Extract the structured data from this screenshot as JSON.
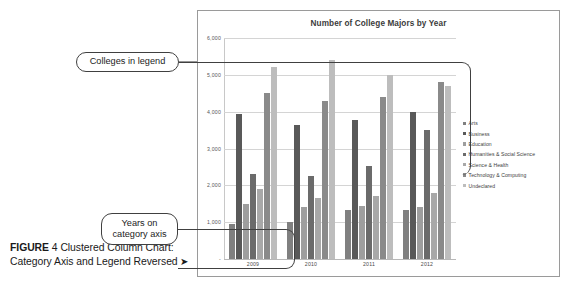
{
  "figure": {
    "caption_label": "FIGURE",
    "caption_number": "4",
    "caption_text": "Clustered Column Chart: Category Axis and Legend Reversed",
    "caption_arrow": "➤"
  },
  "callouts": [
    {
      "id": "legend-callout",
      "text": "Colleges in legend"
    },
    {
      "id": "years-callout",
      "text": "Years on\ncategory axis"
    }
  ],
  "callout_legend_text": "Colleges in legend",
  "callout_years_line1": "Years on",
  "callout_years_line2": "category axis",
  "legend": {
    "position": "right",
    "items": [
      {
        "label": "Arts",
        "color": "#808080"
      },
      {
        "label": "Business",
        "color": "#595959"
      },
      {
        "label": "Education",
        "color": "#9e9e9e"
      },
      {
        "label": "Humanities & Social Science",
        "color": "#6b6b6b"
      },
      {
        "label": "Science & Health",
        "color": "#a8a8a8"
      },
      {
        "label": "Technology & Computing",
        "color": "#8a8a8a"
      },
      {
        "label": "Undeclared",
        "color": "#bdbdbd"
      }
    ]
  },
  "chart_data": {
    "type": "bar",
    "title": "Number of College Majors by Year",
    "xlabel": "",
    "ylabel": "",
    "grid": true,
    "legend_position": "right",
    "categories": [
      "2009",
      "2010",
      "2011",
      "2012"
    ],
    "ylim": [
      0,
      6000
    ],
    "yticks": [
      "-",
      "1,000",
      "2,000",
      "3,000",
      "4,000",
      "5,000",
      "6,000"
    ],
    "ytick_values": [
      0,
      1000,
      2000,
      3000,
      4000,
      5000,
      6000
    ],
    "series": [
      {
        "name": "Arts",
        "color": "#808080",
        "values": [
          950,
          1000,
          1320,
          1320
        ]
      },
      {
        "name": "Business",
        "color": "#595959",
        "values": [
          3950,
          3650,
          3780,
          4000
        ]
      },
      {
        "name": "Education",
        "color": "#9e9e9e",
        "values": [
          1500,
          1420,
          1440,
          1400
        ]
      },
      {
        "name": "Humanities & Social Science",
        "color": "#6b6b6b",
        "values": [
          2300,
          2250,
          2520,
          3500
        ]
      },
      {
        "name": "Science & Health",
        "color": "#a8a8a8",
        "values": [
          1900,
          1650,
          1720,
          1800
        ]
      },
      {
        "name": "Technology & Computing",
        "color": "#8a8a8a",
        "values": [
          4500,
          4300,
          4400,
          4800
        ]
      },
      {
        "name": "Undeclared",
        "color": "#bdbdbd",
        "values": [
          5200,
          5400,
          5000,
          4700
        ]
      }
    ]
  }
}
